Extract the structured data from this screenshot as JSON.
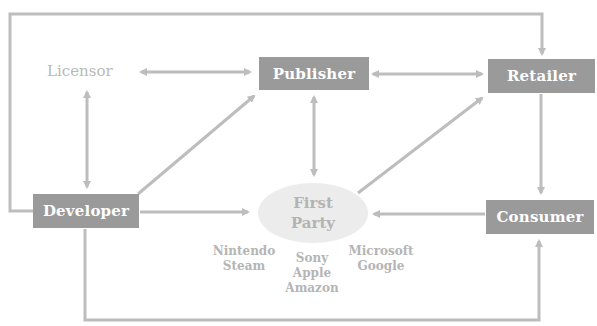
{
  "diagram": {
    "type": "flow-diagram",
    "colors": {
      "box_fill": "#9a9a9a",
      "box_text": "#ffffff",
      "edge": "#bdbdbd",
      "light_text": "#b9b9b9",
      "ellipse_fill": "#ececec"
    },
    "nodes": {
      "licensor": {
        "label": "Licensor"
      },
      "publisher": {
        "label": "Publisher"
      },
      "retailer": {
        "label": "Retailer"
      },
      "developer": {
        "label": "Developer"
      },
      "first_party": {
        "line1": "First",
        "line2": "Party"
      },
      "consumer": {
        "label": "Consumer"
      }
    },
    "platforms": {
      "left": {
        "line1": "Nintendo",
        "line2": "Steam"
      },
      "center": {
        "line1": "Sony",
        "line2": "Apple",
        "line3": "Amazon"
      },
      "right": {
        "line1": "Microsoft",
        "line2": "Google"
      }
    },
    "edges": [
      {
        "from": "Licensor",
        "to": "Publisher",
        "direction": "both"
      },
      {
        "from": "Publisher",
        "to": "Retailer",
        "direction": "both"
      },
      {
        "from": "Licensor",
        "to": "Developer",
        "direction": "both"
      },
      {
        "from": "Developer",
        "to": "Publisher",
        "direction": "forward"
      },
      {
        "from": "Publisher",
        "to": "First Party",
        "direction": "both"
      },
      {
        "from": "First Party",
        "to": "Retailer",
        "direction": "forward"
      },
      {
        "from": "Developer",
        "to": "First Party",
        "direction": "forward"
      },
      {
        "from": "Consumer",
        "to": "First Party",
        "direction": "forward"
      },
      {
        "from": "Retailer",
        "to": "Consumer",
        "direction": "forward"
      },
      {
        "from": "Developer",
        "to": "Retailer",
        "direction": "forward",
        "route": "over top"
      },
      {
        "from": "Developer",
        "to": "Consumer",
        "direction": "forward",
        "route": "under bottom"
      }
    ]
  }
}
